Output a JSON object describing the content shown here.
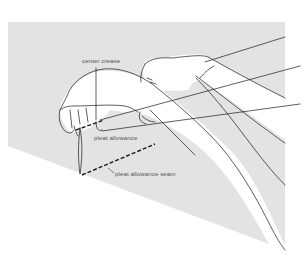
{
  "figure": {
    "background_color": "#e3e3e3",
    "line_color": "#1a1a1a",
    "labels": [
      {
        "id": "center_crease",
        "text": "center crease"
      },
      {
        "id": "pleat_allowance",
        "text": "pleat allowance"
      },
      {
        "id": "pleat_allowance_seam",
        "text": "pleat allowance seam"
      }
    ]
  }
}
